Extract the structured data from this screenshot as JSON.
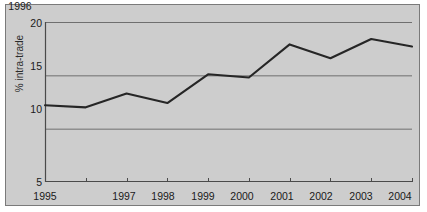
{
  "chart_data": {
    "type": "line",
    "title": "",
    "xlabel": "",
    "ylabel": "% intra-trade",
    "categories": [
      "1995",
      "1996",
      "1997",
      "1998",
      "1999",
      "2000",
      "2001",
      "2002",
      "2003",
      "2004"
    ],
    "x": [
      1995,
      1996,
      1997,
      1998,
      1999,
      2000,
      2001,
      2002,
      2003,
      2004
    ],
    "values": [
      12.2,
      12.0,
      13.3,
      12.4,
      15.1,
      14.8,
      17.9,
      16.6,
      18.4,
      17.7
    ],
    "series": [
      {
        "name": "% intra-trade",
        "values": [
          12.2,
          12.0,
          13.3,
          12.4,
          15.1,
          14.8,
          17.9,
          16.6,
          18.4,
          17.7
        ]
      }
    ],
    "ylim": [
      5,
      20
    ],
    "yticks": [
      5,
      10,
      15,
      20
    ],
    "ytick_labels": [
      "5",
      "10",
      "15",
      "20"
    ],
    "xlim": [
      1995,
      2004
    ],
    "grid": "horizontal",
    "legend": "none",
    "colors": {
      "plot_background": "#cdcdcd",
      "line": "#262626",
      "gridline": "#6f6f6f",
      "axis": "#4a4a4a",
      "frame": "#7a7a7a",
      "text": "#1a1a1a"
    }
  },
  "axes": {
    "y_title": "% intra-trade",
    "y_tick_labels": [
      "20",
      "15",
      "10",
      "5"
    ],
    "x_tick_labels": [
      "1995",
      "1996",
      "1997",
      "1998",
      "1999",
      "2000",
      "2001",
      "2002",
      "2003",
      "2004"
    ]
  }
}
